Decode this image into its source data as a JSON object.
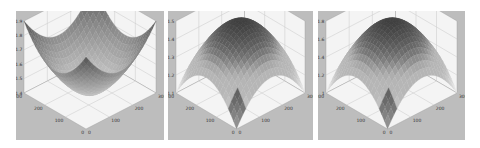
{
  "chart_data": [
    {
      "type": "surface",
      "title": "",
      "shape": "bowl",
      "description": "Concave surface, corners raised to ~1.9, minimum ~1.4 at center",
      "x_ticks": [
        "0",
        "100",
        "200",
        "300"
      ],
      "y_ticks": [
        "0",
        "100",
        "200",
        "300"
      ],
      "z_ticks": [
        "1.4",
        "1.5",
        "1.6",
        "1.7",
        "1.8",
        "1.9"
      ],
      "xlim": [
        0,
        300
      ],
      "ylim": [
        0,
        300
      ],
      "zlim": [
        1.4,
        1.9
      ],
      "grid": true,
      "colormap": "gray"
    },
    {
      "type": "surface",
      "title": "",
      "shape": "dome",
      "description": "Convex dome, peak ~1.5 at center, corners drop to ~1.1",
      "x_ticks": [
        "0",
        "100",
        "200",
        "300"
      ],
      "y_ticks": [
        "0",
        "100",
        "200",
        "300"
      ],
      "z_ticks": [
        "1.1",
        "1.2",
        "1.3",
        "1.4",
        "1.5"
      ],
      "xlim": [
        0,
        300
      ],
      "ylim": [
        0,
        300
      ],
      "zlim": [
        1.1,
        1.5
      ],
      "grid": true,
      "colormap": "gray"
    },
    {
      "type": "surface",
      "title": "",
      "shape": "dome",
      "description": "Convex dome, peak ~1.8 at center, corners drop to ~1.0",
      "x_ticks": [
        "0",
        "100",
        "200",
        "300"
      ],
      "y_ticks": [
        "0",
        "100",
        "200",
        "300"
      ],
      "z_ticks": [
        "1",
        "1.2",
        "1.4",
        "1.6",
        "1.8"
      ],
      "xlim": [
        0,
        300
      ],
      "ylim": [
        0,
        300
      ],
      "zlim": [
        1.0,
        1.8
      ],
      "grid": true,
      "colormap": "gray"
    }
  ],
  "colors": {
    "panel_background": "#bdbdbd",
    "axis_wall": "#f4f4f4",
    "grid_line": "#c8c8c8",
    "surface_dark": "#202020",
    "surface_light": "#f2f2f2"
  }
}
